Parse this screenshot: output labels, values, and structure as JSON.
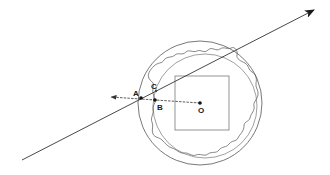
{
  "diagram": {
    "labels": {
      "A": "A",
      "B": "B",
      "C": "C",
      "O": "O"
    },
    "colors": {
      "stroke": "#555555",
      "line": "#333333",
      "background": "#ffffff"
    },
    "elements": {
      "outer_circle": {
        "cx": 200,
        "cy": 103,
        "r": 62
      },
      "inner_circle": {
        "cx": 205,
        "cy": 106,
        "r": 52
      },
      "square": {
        "x": 175,
        "y": 76,
        "w": 54,
        "h": 54
      },
      "ray": {
        "from": [
          22,
          160
        ],
        "to": [
          314,
          10
        ]
      },
      "dashed_vector": {
        "from": [
          200,
          103
        ],
        "to": [
          110,
          97
        ]
      },
      "points": {
        "A": [
          141,
          98
        ],
        "B": [
          155,
          100
        ],
        "O": [
          200,
          103
        ]
      }
    }
  }
}
